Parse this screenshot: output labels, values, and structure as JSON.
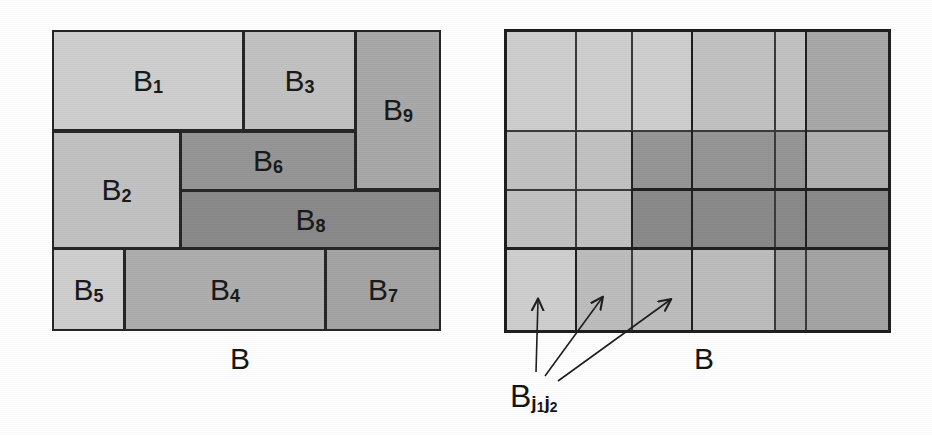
{
  "figure": {
    "title_hidden": "Block partition and its grid refinement",
    "left_panel": {
      "name": "block-partition",
      "caption": "B",
      "blocks": [
        {
          "id": "B1",
          "label": "B",
          "sub": "1",
          "x": 52,
          "y": 30,
          "w": 192,
          "h": 101,
          "shade": "#cfcfcf"
        },
        {
          "id": "B3",
          "label": "B",
          "sub": "3",
          "x": 243,
          "y": 30,
          "w": 113,
          "h": 101,
          "shade": "#c2c2c2"
        },
        {
          "id": "B9",
          "label": "B",
          "sub": "9",
          "x": 355,
          "y": 30,
          "w": 86,
          "h": 160,
          "shade": "#a9a9a9"
        },
        {
          "id": "B2",
          "label": "B",
          "sub": "2",
          "x": 52,
          "y": 131,
          "w": 129,
          "h": 118,
          "shade": "#c2c2c2"
        },
        {
          "id": "B6",
          "label": "B",
          "sub": "6",
          "x": 180,
          "y": 131,
          "w": 176,
          "h": 60,
          "shade": "#969696"
        },
        {
          "id": "B8",
          "label": "B",
          "sub": "8",
          "x": 180,
          "y": 190,
          "w": 261,
          "h": 59,
          "shade": "#8a8a8a"
        },
        {
          "id": "B5",
          "label": "B",
          "sub": "5",
          "x": 52,
          "y": 248,
          "w": 73,
          "h": 83,
          "shade": "#cfcfcf"
        },
        {
          "id": "B4",
          "label": "B",
          "sub": "4",
          "x": 124,
          "y": 248,
          "w": 202,
          "h": 83,
          "shade": "#aeaeae"
        },
        {
          "id": "B7",
          "label": "B",
          "sub": "7",
          "x": 325,
          "y": 248,
          "w": 116,
          "h": 83,
          "shade": "#a4a4a4"
        }
      ]
    },
    "right_panel": {
      "name": "grid-refinement",
      "caption": "B",
      "cell_label": {
        "label": "B",
        "sub1": "j",
        "sub1sub": "1",
        "sub2": "j",
        "sub2sub": "2"
      },
      "x_edges": [
        505,
        576,
        632,
        692,
        775,
        806,
        890
      ],
      "y_edges": [
        30,
        131,
        190,
        249,
        331
      ],
      "cell_shades": [
        [
          "#cfcfcf",
          "#cfcfcf",
          "#cfcfcf",
          "#c2c2c2",
          "#c2c2c2",
          "#a9a9a9"
        ],
        [
          "#c2c2c2",
          "#c2c2c2",
          "#969696",
          "#969696",
          "#969696",
          "#b0b0b0"
        ],
        [
          "#c2c2c2",
          "#c2c2c2",
          "#8a8a8a",
          "#8a8a8a",
          "#8a8a8a",
          "#8a8a8a"
        ],
        [
          "#cfcfcf",
          "#bdbdbd",
          "#bdbdbd",
          "#bdbdbd",
          "#a4a4a4",
          "#a4a4a4"
        ]
      ],
      "heavy_rows": [
        0,
        3,
        4
      ],
      "heavy_cols": [
        0,
        3,
        6
      ],
      "arrows": [
        {
          "name": "arrow-cell-1",
          "x1": 536,
          "y1": 372,
          "x2": 538,
          "y2": 299
        },
        {
          "name": "arrow-cell-2",
          "x1": 545,
          "y1": 376,
          "x2": 603,
          "y2": 297
        },
        {
          "name": "arrow-cell-3",
          "x1": 558,
          "y1": 381,
          "x2": 671,
          "y2": 299
        }
      ]
    },
    "colors": {
      "ink": "#1a1a1a",
      "border": "#262626",
      "background": "#ffffff"
    }
  }
}
